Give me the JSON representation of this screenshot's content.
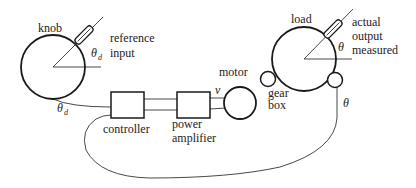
{
  "diagram": {
    "type": "servo position control system",
    "components": {
      "knob": {
        "label": "knob"
      },
      "reference_input": {
        "line1": "reference",
        "line2": "input",
        "angle_symbol": "θ",
        "angle_subscript": "d"
      },
      "feedback_ref_angle": {
        "symbol": "θ",
        "subscript": "d"
      },
      "controller": {
        "label": "controller"
      },
      "power_amplifier": {
        "line1": "power",
        "line2": "amplifier"
      },
      "voltage": {
        "symbol": "v"
      },
      "motor": {
        "label": "motor"
      },
      "gear_box": {
        "line1": "gear",
        "line2": "box"
      },
      "load": {
        "label": "load",
        "angle_symbol": "θ"
      },
      "actual_output": {
        "line1": "actual",
        "line2": "output",
        "line3": "measured"
      },
      "feedback_angle": {
        "symbol": "θ"
      }
    },
    "colors": {
      "stroke": "#1a1a1a",
      "background": "#ffffff",
      "text": "#222222"
    }
  }
}
